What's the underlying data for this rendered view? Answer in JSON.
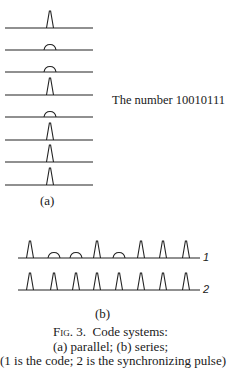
{
  "figure": {
    "parallel": {
      "label": "(a)",
      "number_label": "The number 10010111",
      "bits": [
        1,
        0,
        0,
        1,
        0,
        1,
        1,
        1
      ],
      "line_y": [
        28,
        50,
        72,
        95,
        117,
        140,
        162,
        185
      ],
      "line_x": [
        5,
        93
      ],
      "pulse_x": 50
    },
    "series": {
      "label": "(b)",
      "line1": {
        "tag": "1",
        "y": 258,
        "bits": [
          1,
          0,
          0,
          1,
          0,
          1,
          1,
          1
        ]
      },
      "line2": {
        "tag": "2",
        "y": 290,
        "bits": [
          1,
          1,
          1,
          1,
          1,
          1,
          1,
          1
        ]
      },
      "pulse_x": [
        30,
        54,
        76,
        97,
        119,
        141,
        163,
        186
      ],
      "line_x": [
        18,
        200
      ]
    },
    "caption": {
      "fig_prefix": "Fig. 3.",
      "title": "Code systems:",
      "line2": "(a) parallel; (b) series;",
      "line3": "(1 is the code; 2 is the synchronizing pulse)"
    }
  }
}
